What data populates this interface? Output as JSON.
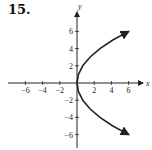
{
  "problem": {
    "number": "15."
  },
  "chart_data": {
    "type": "line",
    "title": "",
    "xlabel": "x",
    "ylabel": "y",
    "xlim": [
      -8,
      7
    ],
    "ylim": [
      -8,
      8
    ],
    "grid": false,
    "x_ticks": [
      -6,
      -4,
      -2,
      2,
      4,
      6
    ],
    "y_ticks": [
      -6,
      -4,
      -2,
      2,
      4,
      6
    ],
    "x_tick_labels": [
      "−6",
      "−4",
      "−2",
      "2",
      "4",
      "6"
    ],
    "y_tick_labels": [
      "−6",
      "−4",
      "−2",
      "2",
      "4",
      "6"
    ],
    "series": [
      {
        "name": "parabola opening right (x = y^2/6)",
        "points": [
          [
            6,
            -6
          ],
          [
            4.17,
            -5
          ],
          [
            2.67,
            -4
          ],
          [
            1.5,
            -3
          ],
          [
            0.67,
            -2
          ],
          [
            0.17,
            -1
          ],
          [
            0,
            0
          ],
          [
            0.17,
            1
          ],
          [
            0.67,
            2
          ],
          [
            1.5,
            3
          ],
          [
            2.67,
            4
          ],
          [
            4.17,
            5
          ],
          [
            6,
            6
          ]
        ],
        "arrows": "both ends",
        "color": "#222222"
      }
    ]
  }
}
